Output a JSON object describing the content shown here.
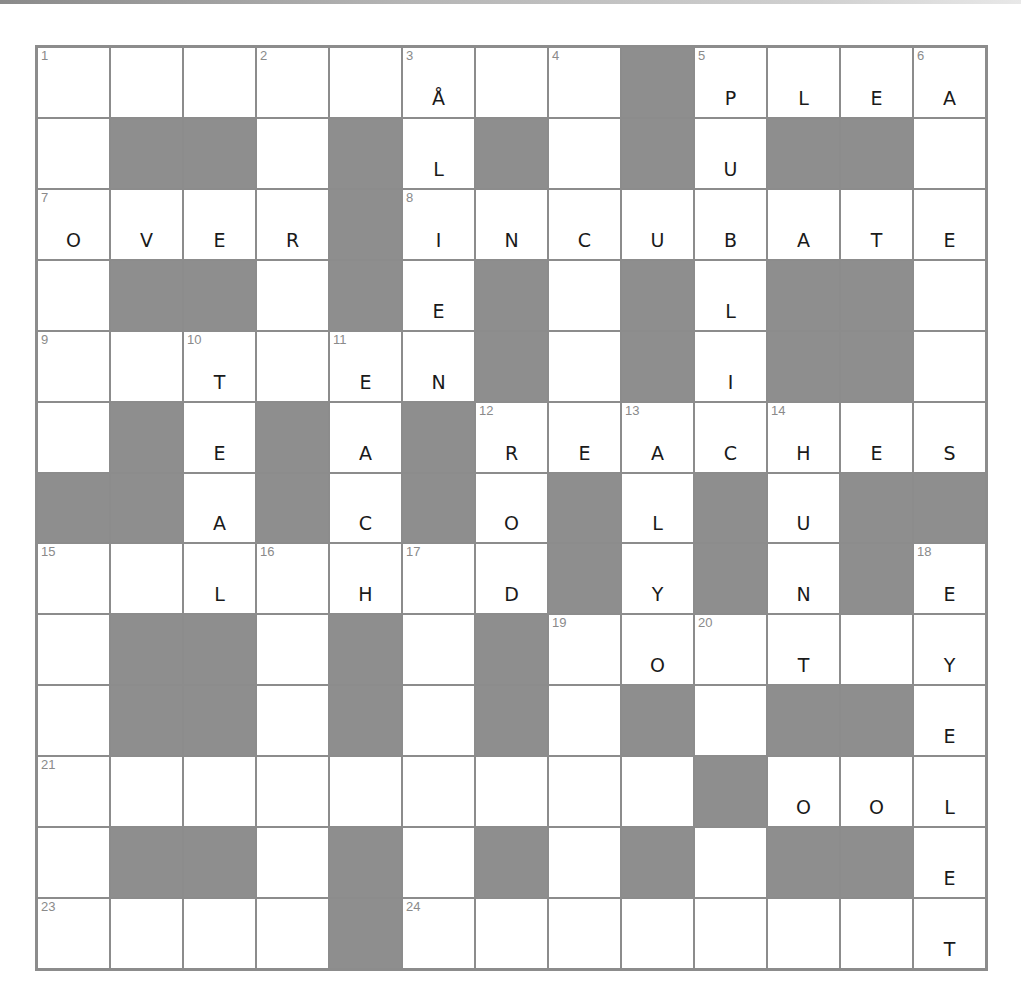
{
  "puzzle": {
    "rows": 13,
    "cols": 13,
    "colors": {
      "black_cell": "#8e8e8e",
      "grid_line": "#8c8c8c",
      "white_cell": "#ffffff",
      "number": "#8a8a8a",
      "ink": "#1a1a1a"
    },
    "layout": [
      "........#....",
      ".##.#.#.#.##.",
      "....#........",
      ".##.#.#.#.##.",
      "......#.#.##.",
      ".#.#.#.......",
      "##.#.#.#.#.##",
      ".......#.#.#.",
      ".##.#.#......",
      ".##.#.#.#.##.",
      ".........#...",
      ".##.#.#.#.##.",
      "....#........"
    ],
    "numbers": [
      {
        "r": 0,
        "c": 0,
        "n": "1"
      },
      {
        "r": 0,
        "c": 3,
        "n": "2"
      },
      {
        "r": 0,
        "c": 5,
        "n": "3"
      },
      {
        "r": 0,
        "c": 7,
        "n": "4"
      },
      {
        "r": 0,
        "c": 9,
        "n": "5"
      },
      {
        "r": 0,
        "c": 12,
        "n": "6"
      },
      {
        "r": 2,
        "c": 0,
        "n": "7"
      },
      {
        "r": 2,
        "c": 5,
        "n": "8"
      },
      {
        "r": 4,
        "c": 0,
        "n": "9"
      },
      {
        "r": 4,
        "c": 2,
        "n": "10"
      },
      {
        "r": 4,
        "c": 4,
        "n": "11"
      },
      {
        "r": 5,
        "c": 6,
        "n": "12"
      },
      {
        "r": 5,
        "c": 8,
        "n": "13"
      },
      {
        "r": 5,
        "c": 10,
        "n": "14"
      },
      {
        "r": 7,
        "c": 0,
        "n": "15"
      },
      {
        "r": 7,
        "c": 3,
        "n": "16"
      },
      {
        "r": 7,
        "c": 5,
        "n": "17"
      },
      {
        "r": 7,
        "c": 12,
        "n": "18"
      },
      {
        "r": 8,
        "c": 7,
        "n": "19"
      },
      {
        "r": 8,
        "c": 9,
        "n": "20"
      },
      {
        "r": 10,
        "c": 0,
        "n": "21"
      },
      {
        "r": 10,
        "c": 9,
        "n": "22"
      },
      {
        "r": 12,
        "c": 0,
        "n": "23"
      },
      {
        "r": 12,
        "c": 5,
        "n": "24"
      }
    ],
    "letters": [
      {
        "r": 0,
        "c": 5,
        "v": "Å"
      },
      {
        "r": 0,
        "c": 9,
        "v": "P"
      },
      {
        "r": 0,
        "c": 10,
        "v": "L"
      },
      {
        "r": 0,
        "c": 11,
        "v": "E"
      },
      {
        "r": 0,
        "c": 12,
        "v": "A"
      },
      {
        "r": 1,
        "c": 5,
        "v": "L"
      },
      {
        "r": 1,
        "c": 9,
        "v": "U"
      },
      {
        "r": 2,
        "c": 0,
        "v": "O"
      },
      {
        "r": 2,
        "c": 1,
        "v": "V"
      },
      {
        "r": 2,
        "c": 2,
        "v": "E"
      },
      {
        "r": 2,
        "c": 3,
        "v": "R"
      },
      {
        "r": 2,
        "c": 5,
        "v": "I"
      },
      {
        "r": 2,
        "c": 6,
        "v": "N"
      },
      {
        "r": 2,
        "c": 7,
        "v": "C"
      },
      {
        "r": 2,
        "c": 8,
        "v": "U"
      },
      {
        "r": 2,
        "c": 9,
        "v": "B"
      },
      {
        "r": 2,
        "c": 10,
        "v": "A"
      },
      {
        "r": 2,
        "c": 11,
        "v": "T"
      },
      {
        "r": 2,
        "c": 12,
        "v": "E"
      },
      {
        "r": 3,
        "c": 5,
        "v": "E"
      },
      {
        "r": 3,
        "c": 9,
        "v": "L"
      },
      {
        "r": 4,
        "c": 2,
        "v": "T"
      },
      {
        "r": 4,
        "c": 4,
        "v": "E"
      },
      {
        "r": 4,
        "c": 5,
        "v": "N"
      },
      {
        "r": 4,
        "c": 9,
        "v": "I"
      },
      {
        "r": 5,
        "c": 2,
        "v": "E"
      },
      {
        "r": 5,
        "c": 4,
        "v": "A"
      },
      {
        "r": 5,
        "c": 6,
        "v": "R"
      },
      {
        "r": 5,
        "c": 7,
        "v": "E"
      },
      {
        "r": 5,
        "c": 8,
        "v": "A"
      },
      {
        "r": 5,
        "c": 9,
        "v": "C"
      },
      {
        "r": 5,
        "c": 10,
        "v": "H"
      },
      {
        "r": 5,
        "c": 11,
        "v": "E"
      },
      {
        "r": 5,
        "c": 12,
        "v": "S"
      },
      {
        "r": 6,
        "c": 2,
        "v": "A"
      },
      {
        "r": 6,
        "c": 4,
        "v": "C"
      },
      {
        "r": 6,
        "c": 6,
        "v": "O"
      },
      {
        "r": 6,
        "c": 8,
        "v": "L"
      },
      {
        "r": 6,
        "c": 10,
        "v": "U"
      },
      {
        "r": 7,
        "c": 2,
        "v": "L"
      },
      {
        "r": 7,
        "c": 4,
        "v": "H"
      },
      {
        "r": 7,
        "c": 6,
        "v": "D"
      },
      {
        "r": 7,
        "c": 8,
        "v": "Y"
      },
      {
        "r": 7,
        "c": 10,
        "v": "N"
      },
      {
        "r": 7,
        "c": 12,
        "v": "E"
      },
      {
        "r": 8,
        "c": 8,
        "v": "O"
      },
      {
        "r": 8,
        "c": 10,
        "v": "T"
      },
      {
        "r": 8,
        "c": 12,
        "v": "Y"
      },
      {
        "r": 9,
        "c": 12,
        "v": "E"
      },
      {
        "r": 10,
        "c": 9,
        "v": "P"
      },
      {
        "r": 10,
        "c": 10,
        "v": "O"
      },
      {
        "r": 10,
        "c": 11,
        "v": "O"
      },
      {
        "r": 10,
        "c": 12,
        "v": "L"
      },
      {
        "r": 11,
        "c": 12,
        "v": "E"
      },
      {
        "r": 12,
        "c": 12,
        "v": "T"
      }
    ]
  }
}
